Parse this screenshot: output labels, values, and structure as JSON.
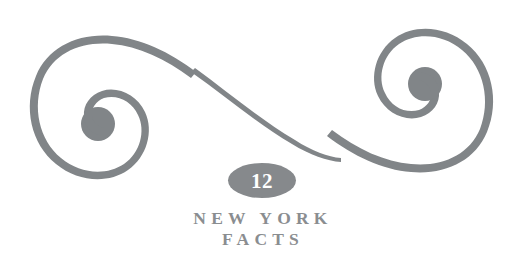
{
  "canvas": {
    "width": 523,
    "height": 256,
    "background_color": "#ffffff"
  },
  "ornament": {
    "name": "double-spiral-flourish",
    "color": "#818588",
    "description": "horizontal S-shaped double spiral scroll flourish"
  },
  "badge": {
    "number": "12",
    "fill_color": "#86898c",
    "text_color": "#ffffff"
  },
  "title": {
    "line1": "NEW YORK",
    "line2": "FACTS",
    "color": "#8a8d90"
  }
}
